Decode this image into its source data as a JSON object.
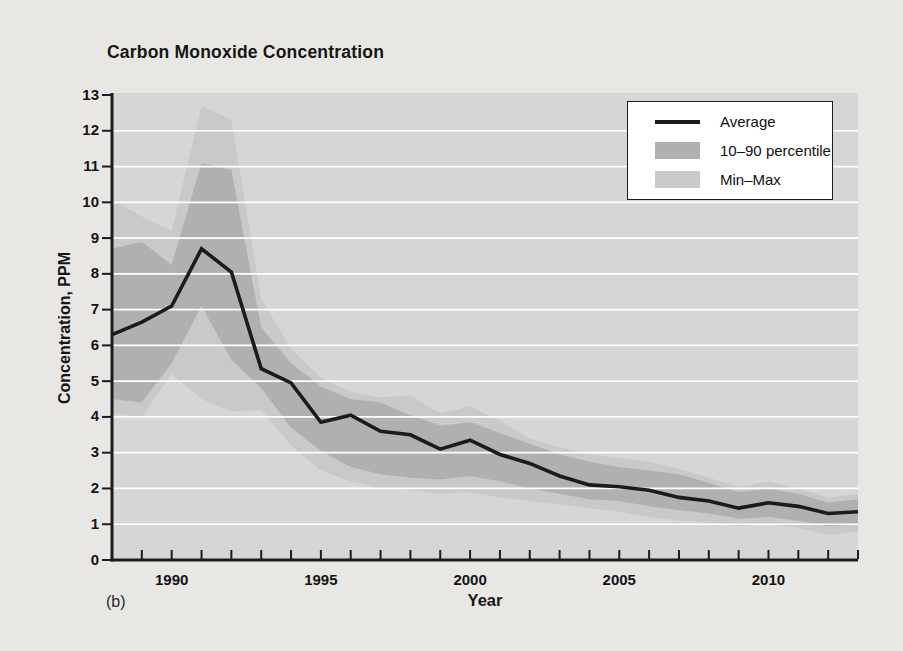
{
  "page": {
    "background": "#e9e7e3"
  },
  "chart": {
    "title": "Carbon Monoxide Concentration",
    "ylabel": "Concentration, PPM",
    "xlabel": "Year",
    "panel_label": "(b)",
    "colors": {
      "page_bg": "#e9e7e3",
      "plot_bg": "#d6d6d6",
      "minmax_band": "#c9c9c9",
      "percentile_band": "#b0b0b0",
      "average_line": "#1b1b1b",
      "gridline": "#ffffff",
      "axis": "#1c1c1c",
      "legend_bg": "#ffffff"
    },
    "legend": {
      "items": [
        {
          "label": "Average",
          "swatch": "line"
        },
        {
          "label": "10–90 percentile",
          "swatch": "percentile_band"
        },
        {
          "label": "Min–Max",
          "swatch": "minmax_band"
        }
      ]
    }
  },
  "chart_data": {
    "type": "line",
    "title": "Carbon Monoxide Concentration",
    "xlabel": "Year",
    "ylabel": "Concentration, PPM",
    "x": [
      1988,
      1989,
      1990,
      1991,
      1992,
      1993,
      1994,
      1995,
      1996,
      1997,
      1998,
      1999,
      2000,
      2001,
      2002,
      2003,
      2004,
      2005,
      2006,
      2007,
      2008,
      2009,
      2010,
      2011,
      2012,
      2013
    ],
    "series": [
      {
        "name": "Average",
        "style": "black line",
        "values": [
          6.3,
          6.65,
          7.1,
          8.7,
          8.05,
          5.35,
          4.95,
          3.85,
          4.05,
          3.6,
          3.5,
          3.1,
          3.35,
          2.95,
          2.7,
          2.35,
          2.1,
          2.05,
          1.95,
          1.75,
          1.65,
          1.45,
          1.6,
          1.5,
          1.3,
          1.35
        ]
      },
      {
        "name": "90th percentile",
        "style": "top of dark gray band",
        "values": [
          8.7,
          8.9,
          8.25,
          11.1,
          10.9,
          6.5,
          5.5,
          4.85,
          4.5,
          4.4,
          4.05,
          3.75,
          3.85,
          3.55,
          3.25,
          2.95,
          2.75,
          2.6,
          2.5,
          2.4,
          2.15,
          1.9,
          2.0,
          1.85,
          1.6,
          1.7
        ]
      },
      {
        "name": "10th percentile",
        "style": "bottom of dark gray band",
        "values": [
          4.5,
          4.4,
          5.5,
          7.1,
          5.6,
          4.8,
          3.7,
          3.05,
          2.6,
          2.4,
          2.3,
          2.25,
          2.35,
          2.2,
          2.0,
          1.85,
          1.7,
          1.65,
          1.5,
          1.4,
          1.3,
          1.15,
          1.2,
          1.1,
          0.95,
          1.0
        ]
      },
      {
        "name": "Max",
        "style": "top of light gray band",
        "values": [
          10.1,
          9.6,
          9.2,
          12.7,
          12.3,
          7.3,
          5.9,
          5.1,
          4.7,
          4.55,
          4.6,
          4.1,
          4.3,
          3.9,
          3.4,
          3.15,
          2.95,
          2.85,
          2.75,
          2.55,
          2.3,
          2.05,
          2.2,
          2.0,
          1.75,
          1.85
        ]
      },
      {
        "name": "Min",
        "style": "bottom of light gray band",
        "values": [
          4.1,
          4.0,
          5.2,
          4.5,
          4.15,
          4.2,
          3.2,
          2.5,
          2.2,
          2.0,
          1.95,
          1.85,
          1.9,
          1.75,
          1.65,
          1.55,
          1.45,
          1.35,
          1.2,
          1.1,
          1.05,
          0.95,
          1.0,
          0.9,
          0.7,
          0.8
        ]
      }
    ],
    "xlim": [
      1988,
      2013
    ],
    "ylim": [
      0,
      13
    ],
    "yticks": [
      0,
      1,
      2,
      3,
      4,
      5,
      6,
      7,
      8,
      9,
      10,
      11,
      12,
      13
    ],
    "xticks_minor_every": 1,
    "xticks_labeled": [
      1990,
      1995,
      2000,
      2005,
      2010
    ],
    "grid": "horizontal white lines at integer values 1-12, drawn over bands",
    "legend_position": "upper right",
    "legend_entries": [
      "Average",
      "10–90 percentile",
      "Min–Max"
    ]
  }
}
